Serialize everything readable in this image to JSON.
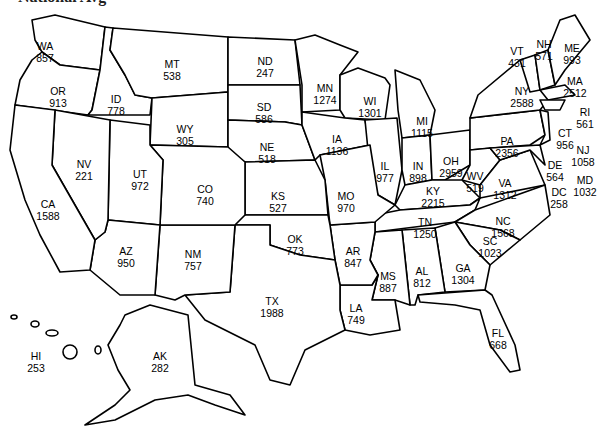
{
  "header": {
    "title": "National Avg"
  },
  "map": {
    "type": "choropleth-labels",
    "region": "United States",
    "states": [
      {
        "abbr": "WA",
        "value": 857,
        "x": 45,
        "y": 40
      },
      {
        "abbr": "OR",
        "value": 913,
        "x": 58,
        "y": 85
      },
      {
        "abbr": "ID",
        "value": 778,
        "x": 116,
        "y": 93
      },
      {
        "abbr": "MT",
        "value": 538,
        "x": 172,
        "y": 58
      },
      {
        "abbr": "WY",
        "value": 305,
        "x": 185,
        "y": 123
      },
      {
        "abbr": "ND",
        "value": 247,
        "x": 265,
        "y": 55
      },
      {
        "abbr": "SD",
        "value": 586,
        "x": 264,
        "y": 101
      },
      {
        "abbr": "NE",
        "value": 518,
        "x": 267,
        "y": 141
      },
      {
        "abbr": "MN",
        "value": 1274,
        "x": 325,
        "y": 82
      },
      {
        "abbr": "WI",
        "value": 1301,
        "x": 370,
        "y": 95
      },
      {
        "abbr": "MI",
        "value": 1115,
        "x": 422,
        "y": 115
      },
      {
        "abbr": "IA",
        "value": 1136,
        "x": 337,
        "y": 133
      },
      {
        "abbr": "IL",
        "value": 977,
        "x": 385,
        "y": 160
      },
      {
        "abbr": "IN",
        "value": 898,
        "x": 418,
        "y": 160
      },
      {
        "abbr": "OH",
        "value": 2959,
        "x": 451,
        "y": 155
      },
      {
        "abbr": "PA",
        "value": 2356,
        "x": 507,
        "y": 135
      },
      {
        "abbr": "NY",
        "value": 2588,
        "x": 522,
        "y": 85
      },
      {
        "abbr": "VT",
        "value": 431,
        "x": 517,
        "y": 45
      },
      {
        "abbr": "NH",
        "value": 571,
        "x": 544,
        "y": 38
      },
      {
        "abbr": "ME",
        "value": 993,
        "x": 572,
        "y": 42
      },
      {
        "abbr": "MA",
        "value": 2512,
        "x": 575,
        "y": 75
      },
      {
        "abbr": "RI",
        "value": 561,
        "x": 585,
        "y": 106
      },
      {
        "abbr": "CT",
        "value": 956,
        "x": 565,
        "y": 127
      },
      {
        "abbr": "NJ",
        "value": 1058,
        "x": 583,
        "y": 144
      },
      {
        "abbr": "DE",
        "value": 564,
        "x": 555,
        "y": 159
      },
      {
        "abbr": "MD",
        "value": 1032,
        "x": 585,
        "y": 174
      },
      {
        "abbr": "DC",
        "value": 258,
        "x": 559,
        "y": 186
      },
      {
        "abbr": "WV",
        "value": 519,
        "x": 475,
        "y": 170
      },
      {
        "abbr": "VA",
        "value": 1312,
        "x": 505,
        "y": 177
      },
      {
        "abbr": "KY",
        "value": 2215,
        "x": 433,
        "y": 185
      },
      {
        "abbr": "TN",
        "value": 1250,
        "x": 425,
        "y": 216
      },
      {
        "abbr": "NC",
        "value": 1568,
        "x": 503,
        "y": 215
      },
      {
        "abbr": "SC",
        "value": 1023,
        "x": 490,
        "y": 235
      },
      {
        "abbr": "GA",
        "value": 1304,
        "x": 463,
        "y": 262
      },
      {
        "abbr": "AL",
        "value": 812,
        "x": 422,
        "y": 265
      },
      {
        "abbr": "MS",
        "value": 887,
        "x": 388,
        "y": 270
      },
      {
        "abbr": "LA",
        "value": 749,
        "x": 356,
        "y": 302
      },
      {
        "abbr": "AR",
        "value": 847,
        "x": 353,
        "y": 245
      },
      {
        "abbr": "MO",
        "value": 970,
        "x": 346,
        "y": 190
      },
      {
        "abbr": "KS",
        "value": 527,
        "x": 278,
        "y": 190
      },
      {
        "abbr": "OK",
        "value": 773,
        "x": 295,
        "y": 233
      },
      {
        "abbr": "TX",
        "value": 1988,
        "x": 272,
        "y": 295
      },
      {
        "abbr": "NM",
        "value": 757,
        "x": 193,
        "y": 248
      },
      {
        "abbr": "AZ",
        "value": 950,
        "x": 126,
        "y": 245
      },
      {
        "abbr": "CO",
        "value": 740,
        "x": 205,
        "y": 183
      },
      {
        "abbr": "UT",
        "value": 972,
        "x": 140,
        "y": 168
      },
      {
        "abbr": "NV",
        "value": 221,
        "x": 84,
        "y": 158
      },
      {
        "abbr": "CA",
        "value": 1588,
        "x": 48,
        "y": 198
      },
      {
        "abbr": "FL",
        "value": 668,
        "x": 498,
        "y": 327
      },
      {
        "abbr": "AK",
        "value": 282,
        "x": 160,
        "y": 350
      },
      {
        "abbr": "HI",
        "value": 253,
        "x": 36,
        "y": 350
      }
    ]
  }
}
